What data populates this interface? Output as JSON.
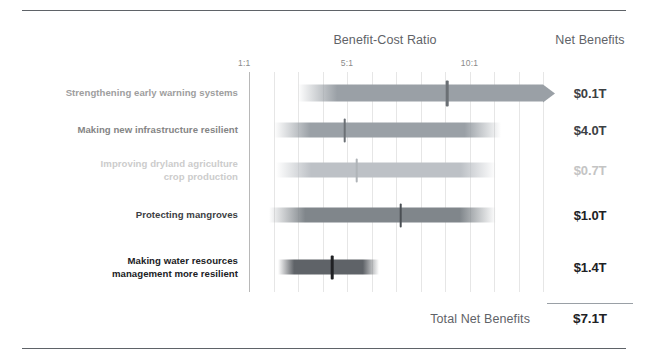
{
  "headers": {
    "benefit_cost_ratio": "Benefit-Cost Ratio",
    "net_benefits": "Net Benefits"
  },
  "axis": {
    "ticks": [
      {
        "label": "1:1",
        "value": 1
      },
      {
        "label": "5:1",
        "value": 5
      },
      {
        "label": "10:1",
        "value": 10
      }
    ]
  },
  "total": {
    "label": "Total Net Benefits",
    "value": "$7.1T"
  },
  "colors": {
    "rule": "#5f6368",
    "gridline": "#e6e6e6",
    "axis": "#b8b8b8",
    "header_text": "#5f6368",
    "tick_text": "#8a8a8a",
    "total_value": "#202124"
  },
  "chart_data": {
    "type": "bar",
    "title": "Benefit-Cost Ratio",
    "xlabel": "Benefit-Cost Ratio",
    "ylabel": "",
    "xlim": [
      1,
      13
    ],
    "grid": true,
    "legend": "none",
    "categories": [
      "Strengthening early warning systems",
      "Making new infrastructure resilient",
      "Improving dryland agriculture crop production",
      "Protecting mangroves",
      "Making water resources management more resilient"
    ],
    "series": [
      {
        "name": "Net Benefits",
        "values": [
          "$0.1T",
          "$4.0T",
          "$0.7T",
          "$1.0T",
          "$1.4T"
        ]
      }
    ],
    "rows": [
      {
        "label_lines": [
          "Strengthening early warning systems"
        ],
        "net_benefit": "$0.1T",
        "ratio_low": 3.0,
        "ratio_high": 13.0,
        "ratio_point": 9.1,
        "open_ended": true,
        "label_color": "#9e9e9e",
        "value_color": "#3c4043",
        "bar_color": "#9aa0a6",
        "tick_color": "#6b7075",
        "center_y": 93
      },
      {
        "label_lines": [
          "Making new infrastructure resilient"
        ],
        "net_benefit": "$4.0T",
        "ratio_low": 2.0,
        "ratio_high": 11.3,
        "ratio_point": 4.9,
        "open_ended": false,
        "label_color": "#858585",
        "value_color": "#3c4043",
        "bar_color": "#9aa0a6",
        "tick_color": "#6b7075",
        "center_y": 130
      },
      {
        "label_lines": [
          "Improving dryland agriculture",
          "crop production"
        ],
        "net_benefit": "$0.7T",
        "ratio_low": 2.1,
        "ratio_high": 11.1,
        "ratio_point": 5.4,
        "open_ended": false,
        "label_color": "#cccccc",
        "value_color": "#c4c4c4",
        "bar_color": "#bdc1c6",
        "tick_color": "#b0b4b8",
        "center_y": 170
      },
      {
        "label_lines": [
          "Protecting mangroves"
        ],
        "net_benefit": "$1.0T",
        "ratio_low": 1.8,
        "ratio_high": 11.1,
        "ratio_point": 7.2,
        "open_ended": false,
        "label_color": "#3c4043",
        "value_color": "#202124",
        "bar_color": "#80868b",
        "tick_color": "#4a4f54",
        "center_y": 215
      },
      {
        "label_lines": [
          "Making water resources",
          "management more resilient"
        ],
        "net_benefit": "$1.4T",
        "ratio_low": 2.2,
        "ratio_high": 6.3,
        "ratio_point": 4.4,
        "open_ended": false,
        "label_color": "#202124",
        "value_color": "#202124",
        "bar_color": "#5f6368",
        "tick_color": "#202124",
        "center_y": 267
      }
    ]
  }
}
